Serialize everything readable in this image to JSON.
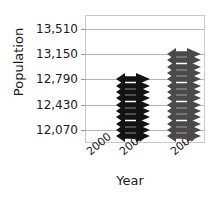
{
  "chart_data": {
    "type": "scatter",
    "title": "",
    "xlabel": "Year",
    "ylabel": "Population",
    "grid": true,
    "legend": null,
    "ylim": [
      11900,
      13690
    ],
    "yticks": [
      12070,
      12430,
      12790,
      13150,
      13510
    ],
    "ytick_labels": [
      "12,070",
      "12,430",
      "12,790",
      "13,150",
      "13,510"
    ],
    "xticks": [
      2000,
      2002,
      2005
    ],
    "xtick_labels": [
      "2000",
      "2002",
      "2005"
    ],
    "xlim": [
      1999.2,
      2006.2
    ],
    "series": [
      {
        "name": "2002",
        "color": "#131313",
        "x": 2002,
        "values": [
          12790,
          12700,
          12610,
          12520,
          12430,
          12340,
          12250,
          12160,
          12070,
          11990
        ]
      },
      {
        "name": "2005",
        "color": "#4a4a4a",
        "x": 2005,
        "values": [
          13150,
          13060,
          12970,
          12880,
          12790,
          12700,
          12610,
          12520,
          12430,
          12340,
          12250,
          12160,
          12070,
          11990
        ]
      }
    ]
  }
}
